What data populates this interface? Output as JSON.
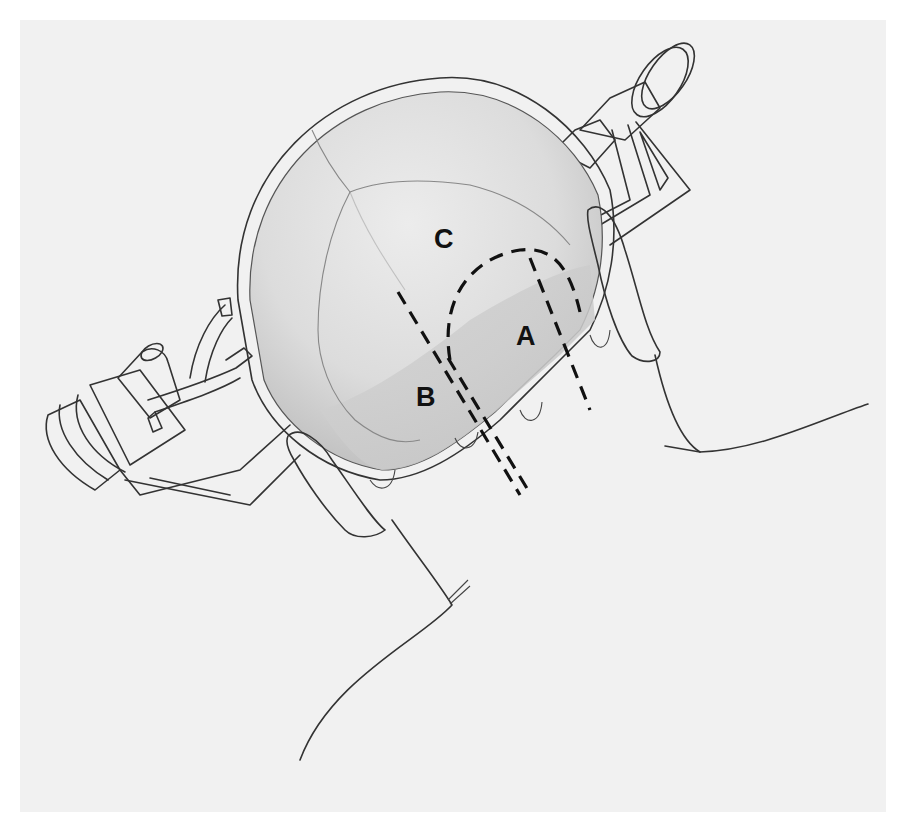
{
  "figure": {
    "labels": [
      {
        "id": "A",
        "text": "A"
      },
      {
        "id": "B",
        "text": "B"
      },
      {
        "id": "C",
        "text": "C"
      }
    ],
    "colors": {
      "background": "#ffffff",
      "panel": "#f1f1f1",
      "line": "#333333",
      "dashes": "#111111",
      "skull_shading": "#cfcfcf"
    }
  }
}
